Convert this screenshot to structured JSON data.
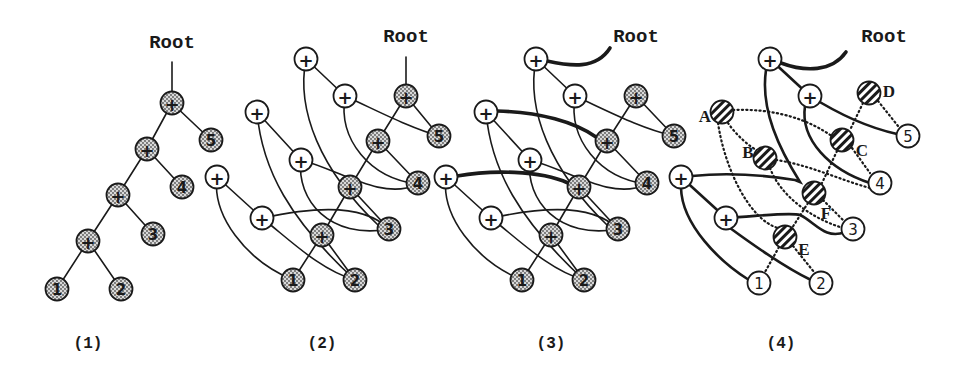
{
  "figure": {
    "width": 966,
    "height": 365,
    "node_radius": 11.5,
    "colors": {
      "ink": "#1a1a1a",
      "background": "#ffffff",
      "stipple": "#8a8a8a"
    }
  },
  "panels": [
    {
      "id": "1",
      "label": "(1)",
      "label_pos": [
        88,
        348
      ],
      "root": {
        "text": "Root",
        "pos": [
          172,
          48
        ]
      },
      "nodes": [
        {
          "id": "p1",
          "type": "shaded",
          "text": "+",
          "pos": [
            172,
            103
          ]
        },
        {
          "id": "p2",
          "type": "shaded",
          "text": "+",
          "pos": [
            147,
            149
          ]
        },
        {
          "id": "p3",
          "type": "shaded",
          "text": "+",
          "pos": [
            118,
            195
          ]
        },
        {
          "id": "p4",
          "type": "shaded",
          "text": "+",
          "pos": [
            88,
            241
          ]
        },
        {
          "id": "n5",
          "type": "shaded",
          "text": "5",
          "pos": [
            211,
            140
          ]
        },
        {
          "id": "n4",
          "type": "shaded",
          "text": "4",
          "pos": [
            182,
            187
          ]
        },
        {
          "id": "n3",
          "type": "shaded",
          "text": "3",
          "pos": [
            153,
            234
          ]
        },
        {
          "id": "n1",
          "type": "shaded",
          "text": "1",
          "pos": [
            57,
            289
          ]
        },
        {
          "id": "n2",
          "type": "shaded",
          "text": "2",
          "pos": [
            121,
            289
          ]
        }
      ],
      "edges": [
        {
          "style": "thin",
          "d": "M172,62 L172,92"
        },
        {
          "style": "thin",
          "d": "M172,103 L147,149"
        },
        {
          "style": "thin",
          "d": "M172,103 L211,140"
        },
        {
          "style": "thin",
          "d": "M147,149 L118,195"
        },
        {
          "style": "thin",
          "d": "M147,149 L182,187"
        },
        {
          "style": "thin",
          "d": "M118,195 L88,241"
        },
        {
          "style": "thin",
          "d": "M118,195 L153,234"
        },
        {
          "style": "thin",
          "d": "M88,241 L57,289"
        },
        {
          "style": "thin",
          "d": "M88,241 L121,289"
        }
      ]
    },
    {
      "id": "2",
      "label": "(2)",
      "label_pos": [
        322,
        348
      ],
      "root": {
        "text": "Root",
        "pos": [
          406,
          42
        ]
      },
      "nodes": [
        {
          "id": "a1",
          "type": "plus",
          "text": "+",
          "pos": [
            306,
            59
          ]
        },
        {
          "id": "a2",
          "type": "plus",
          "text": "+",
          "pos": [
            345,
            96
          ]
        },
        {
          "id": "a3",
          "type": "plus",
          "text": "+",
          "pos": [
            257,
            112
          ]
        },
        {
          "id": "a4",
          "type": "plus",
          "text": "+",
          "pos": [
            301,
            160
          ]
        },
        {
          "id": "a5",
          "type": "plus",
          "text": "+",
          "pos": [
            217,
            177
          ]
        },
        {
          "id": "a6",
          "type": "plus",
          "text": "+",
          "pos": [
            262,
            218
          ]
        },
        {
          "id": "s1",
          "type": "shaded",
          "text": "+",
          "pos": [
            406,
            96
          ]
        },
        {
          "id": "s2",
          "type": "shaded",
          "text": "+",
          "pos": [
            378,
            141
          ]
        },
        {
          "id": "s3",
          "type": "shaded",
          "text": "+",
          "pos": [
            350,
            187
          ]
        },
        {
          "id": "s4",
          "type": "shaded",
          "text": "+",
          "pos": [
            322,
            235
          ]
        },
        {
          "id": "n5",
          "type": "shaded",
          "text": "5",
          "pos": [
            439,
            136
          ]
        },
        {
          "id": "n4",
          "type": "shaded",
          "text": "4",
          "pos": [
            418,
            183
          ]
        },
        {
          "id": "n3",
          "type": "shaded",
          "text": "3",
          "pos": [
            389,
            229
          ]
        },
        {
          "id": "n1",
          "type": "shaded",
          "text": "1",
          "pos": [
            293,
            280
          ]
        },
        {
          "id": "n2",
          "type": "shaded",
          "text": "2",
          "pos": [
            355,
            280
          ]
        }
      ],
      "edges": [
        {
          "style": "thin",
          "d": "M406,57 L406,85"
        },
        {
          "style": "thin",
          "d": "M406,96 L378,141"
        },
        {
          "style": "thin",
          "d": "M406,96 L439,136"
        },
        {
          "style": "thin",
          "d": "M378,141 L350,187"
        },
        {
          "style": "thin",
          "d": "M378,141 L418,183"
        },
        {
          "style": "thin",
          "d": "M350,187 L322,235"
        },
        {
          "style": "thin",
          "d": "M350,187 L389,229"
        },
        {
          "style": "thin",
          "d": "M322,235 L293,280"
        },
        {
          "style": "thin",
          "d": "M322,235 L355,280"
        },
        {
          "style": "thin",
          "d": "M306,59 L345,96"
        },
        {
          "style": "thin",
          "d": "M306,59 C296,110 320,170 379,226"
        },
        {
          "style": "thin",
          "d": "M345,96 C380,112 410,128 439,136"
        },
        {
          "style": "thin",
          "d": "M345,96 C338,140 370,178 417,184"
        },
        {
          "style": "thin",
          "d": "M257,112 L301,160"
        },
        {
          "style": "thin",
          "d": "M257,112 C262,170 290,220 355,280"
        },
        {
          "style": "thin",
          "d": "M301,160 C340,170 380,200 417,185"
        },
        {
          "style": "thin",
          "d": "M301,160 C296,200 330,240 389,229"
        },
        {
          "style": "thin",
          "d": "M217,177 L262,218"
        },
        {
          "style": "thin",
          "d": "M217,177 C212,215 245,260 293,280"
        },
        {
          "style": "thin",
          "d": "M262,218 C300,210 360,200 389,229"
        },
        {
          "style": "thin",
          "d": "M262,218 C290,240 320,270 355,280"
        }
      ]
    },
    {
      "id": "3",
      "label": "(3)",
      "label_pos": [
        551,
        348
      ],
      "root": {
        "text": "Root",
        "pos": [
          636,
          42
        ]
      },
      "nodes": [
        {
          "id": "a1",
          "type": "plus",
          "text": "+",
          "pos": [
            536,
            59
          ]
        },
        {
          "id": "a2",
          "type": "plus",
          "text": "+",
          "pos": [
            575,
            96
          ]
        },
        {
          "id": "a3",
          "type": "plus",
          "text": "+",
          "pos": [
            486,
            112
          ]
        },
        {
          "id": "a4",
          "type": "plus",
          "text": "+",
          "pos": [
            530,
            160
          ]
        },
        {
          "id": "a5",
          "type": "plus",
          "text": "+",
          "pos": [
            446,
            177
          ]
        },
        {
          "id": "a6",
          "type": "plus",
          "text": "+",
          "pos": [
            491,
            218
          ]
        },
        {
          "id": "s1",
          "type": "shaded",
          "text": "+",
          "pos": [
            636,
            96
          ]
        },
        {
          "id": "s2",
          "type": "shaded",
          "text": "+",
          "pos": [
            607,
            141
          ]
        },
        {
          "id": "s3",
          "type": "shaded",
          "text": "+",
          "pos": [
            579,
            187
          ]
        },
        {
          "id": "s4",
          "type": "shaded",
          "text": "+",
          "pos": [
            551,
            235
          ]
        },
        {
          "id": "n5",
          "type": "shaded",
          "text": "5",
          "pos": [
            674,
            136
          ]
        },
        {
          "id": "n4",
          "type": "shaded",
          "text": "4",
          "pos": [
            647,
            183
          ]
        },
        {
          "id": "n3",
          "type": "shaded",
          "text": "3",
          "pos": [
            618,
            229
          ]
        },
        {
          "id": "n1",
          "type": "shaded",
          "text": "1",
          "pos": [
            522,
            280
          ]
        },
        {
          "id": "n2",
          "type": "shaded",
          "text": "2",
          "pos": [
            584,
            280
          ]
        }
      ],
      "edges": [
        {
          "style": "thick",
          "d": "M610,48 C596,70 570,66 547,61"
        },
        {
          "style": "thick",
          "d": "M497,111 C540,112 575,122 596,137"
        },
        {
          "style": "thick",
          "d": "M457,176 C490,170 540,170 568,183"
        },
        {
          "style": "thin",
          "d": "M636,96 L607,141"
        },
        {
          "style": "thin",
          "d": "M636,96 L674,136"
        },
        {
          "style": "thin",
          "d": "M607,141 L579,187"
        },
        {
          "style": "thin",
          "d": "M607,141 L647,183"
        },
        {
          "style": "thin",
          "d": "M579,187 L551,235"
        },
        {
          "style": "thin",
          "d": "M579,187 L618,229"
        },
        {
          "style": "thin",
          "d": "M551,235 L522,280"
        },
        {
          "style": "thin",
          "d": "M551,235 L584,280"
        },
        {
          "style": "thin",
          "d": "M536,59 L575,96"
        },
        {
          "style": "thin",
          "d": "M536,59 C526,110 550,170 608,226"
        },
        {
          "style": "thin",
          "d": "M575,96 C610,112 640,128 674,136"
        },
        {
          "style": "thin",
          "d": "M575,96 C568,140 600,178 646,184"
        },
        {
          "style": "thin",
          "d": "M486,112 L530,160"
        },
        {
          "style": "thin",
          "d": "M486,112 C491,170 519,220 584,280"
        },
        {
          "style": "thin",
          "d": "M530,160 C569,170 609,200 646,185"
        },
        {
          "style": "thin",
          "d": "M530,160 C525,200 559,240 618,229"
        },
        {
          "style": "thin",
          "d": "M446,177 L491,218"
        },
        {
          "style": "thin",
          "d": "M446,177 C441,215 474,260 522,280"
        },
        {
          "style": "thin",
          "d": "M491,218 C529,210 589,200 618,229"
        },
        {
          "style": "thin",
          "d": "M491,218 C519,240 549,270 584,280"
        }
      ]
    },
    {
      "id": "4",
      "label": "(4)",
      "label_pos": [
        781,
        348
      ],
      "root": {
        "text": "Root",
        "pos": [
          884,
          42
        ]
      },
      "nodes": [
        {
          "id": "a1",
          "type": "plus",
          "text": "+",
          "pos": [
            770,
            59
          ]
        },
        {
          "id": "a2",
          "type": "plus",
          "text": "+",
          "pos": [
            810,
            96
          ]
        },
        {
          "id": "a5",
          "type": "plus",
          "text": "+",
          "pos": [
            681,
            177
          ]
        },
        {
          "id": "a6",
          "type": "plus",
          "text": "+",
          "pos": [
            726,
            218
          ]
        },
        {
          "id": "A",
          "type": "hatched",
          "text": "",
          "pos": [
            722,
            112
          ],
          "label": "A",
          "label_pos": [
            705,
            116
          ]
        },
        {
          "id": "B",
          "type": "hatched",
          "text": "",
          "pos": [
            765,
            158
          ],
          "label": "B",
          "label_pos": [
            748,
            152
          ]
        },
        {
          "id": "C",
          "type": "hatched",
          "text": "",
          "pos": [
            842,
            140
          ],
          "label": "C",
          "label_pos": [
            862,
            150
          ]
        },
        {
          "id": "D",
          "type": "hatched",
          "text": "",
          "pos": [
            869,
            93
          ],
          "label": "D",
          "label_pos": [
            889,
            91
          ]
        },
        {
          "id": "E",
          "type": "hatched",
          "text": "",
          "pos": [
            785,
            237
          ],
          "label": "E",
          "label_pos": [
            804,
            249
          ]
        },
        {
          "id": "F",
          "type": "hatched",
          "text": "",
          "pos": [
            814,
            193
          ],
          "label": "F",
          "label_pos": [
            826,
            213
          ]
        },
        {
          "id": "n5",
          "type": "leaf",
          "text": "5",
          "pos": [
            908,
            136
          ]
        },
        {
          "id": "n4",
          "type": "leaf",
          "text": "4",
          "pos": [
            880,
            183
          ]
        },
        {
          "id": "n3",
          "type": "leaf",
          "text": "3",
          "pos": [
            853,
            229
          ]
        },
        {
          "id": "n1",
          "type": "leaf",
          "text": "1",
          "pos": [
            759,
            283
          ]
        },
        {
          "id": "n2",
          "type": "leaf",
          "text": "2",
          "pos": [
            821,
            283
          ]
        }
      ],
      "edges": [
        {
          "style": "thick",
          "d": "M846,52 C832,72 805,72 781,63"
        },
        {
          "style": "thin-bold",
          "d": "M770,59 L810,96"
        },
        {
          "style": "thin-bold",
          "d": "M810,96 C840,115 870,128 897,134"
        },
        {
          "style": "thin-bold",
          "d": "M805,106 C800,140 830,170 870,183"
        },
        {
          "style": "thin-bold",
          "d": "M766,70 C760,110 780,150 800,182 L795,180 C770,176 730,172 692,176"
        },
        {
          "style": "thin-bold",
          "d": "M681,177 L726,218"
        },
        {
          "style": "thin-bold",
          "d": "M681,188 C682,225 720,262 749,280"
        },
        {
          "style": "thin-bold",
          "d": "M726,218 C760,216 790,212 800,215 C815,222 825,240 845,232"
        },
        {
          "style": "thin-bold",
          "d": "M730,228 C760,250 790,270 811,280"
        },
        {
          "style": "dotted",
          "d": "M733,110 C775,108 810,120 833,137"
        },
        {
          "style": "dotted",
          "d": "M728,123 C736,135 750,147 758,151"
        },
        {
          "style": "dotted",
          "d": "M718,123 C725,170 750,220 778,228"
        },
        {
          "style": "dotted",
          "d": "M776,160 C810,165 840,180 870,188"
        },
        {
          "style": "dotted",
          "d": "M770,168 C780,195 810,218 843,228"
        },
        {
          "style": "dotted",
          "d": "M837,151 L822,183"
        },
        {
          "style": "dotted",
          "d": "M852,148 L870,173"
        },
        {
          "style": "dotted",
          "d": "M863,103 L850,130"
        },
        {
          "style": "dotted",
          "d": "M878,101 L898,126"
        },
        {
          "style": "dotted",
          "d": "M808,203 L792,228"
        },
        {
          "style": "dotted",
          "d": "M823,200 L843,220"
        },
        {
          "style": "dotted",
          "d": "M779,247 L765,272"
        },
        {
          "style": "dotted",
          "d": "M793,246 L814,272"
        }
      ]
    }
  ]
}
